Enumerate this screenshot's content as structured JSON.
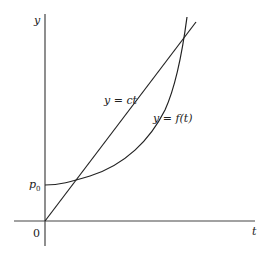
{
  "diagram": {
    "axes": {
      "y_label": "y",
      "x_label": "t",
      "origin_label": "0"
    },
    "markers": {
      "p0_label_base": "p",
      "p0_label_sub": "0"
    },
    "curves": [
      {
        "name": "line",
        "label": "y = ct",
        "type": "linear"
      },
      {
        "name": "curve",
        "label": "y = f(t)",
        "type": "convex"
      }
    ],
    "colors": {
      "stroke": "#222222",
      "axis": "#444444",
      "background": "#ffffff"
    }
  }
}
